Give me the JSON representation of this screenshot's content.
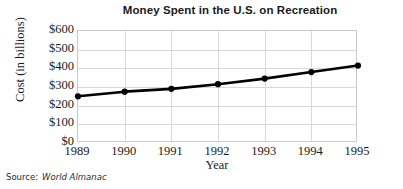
{
  "chart_data": {
    "type": "line",
    "title": "Money Spent in the U.S. on Recreation",
    "xlabel": "Year",
    "ylabel": "Cost (in billions)",
    "categories": [
      "1989",
      "1990",
      "1991",
      "1992",
      "1993",
      "1994",
      "1995"
    ],
    "x": [
      1989,
      1990,
      1991,
      1992,
      1993,
      1994,
      1995
    ],
    "values": [
      250,
      275,
      290,
      315,
      345,
      380,
      415
    ],
    "series": [
      {
        "name": "Money spent on recreation",
        "values": [
          250,
          275,
          290,
          315,
          345,
          380,
          415
        ]
      }
    ],
    "ylim": [
      0,
      600
    ],
    "xlim": [
      1989,
      1995
    ],
    "ytick_labels": [
      "$0",
      "$100",
      "$200",
      "$300",
      "$400",
      "$500",
      "$600"
    ],
    "ytick_values": [
      0,
      100,
      200,
      300,
      400,
      500,
      600
    ],
    "xtick_labels": [
      "1989",
      "1990",
      "1991",
      "1992",
      "1993",
      "1994",
      "1995"
    ],
    "grid": true,
    "legend": false,
    "marker": "filled-circle",
    "line_color": "#000000",
    "grid_color": "#d8d8d8",
    "frame_color": "#c9c9c9",
    "background_color": "#ffffff"
  },
  "source": {
    "label": "Source:",
    "value": "World Almanac"
  }
}
